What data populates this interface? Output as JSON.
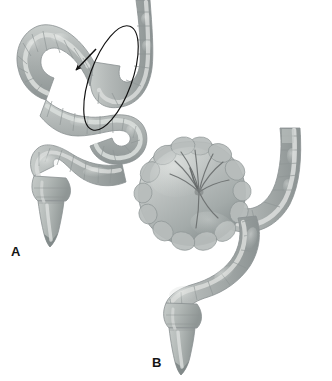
{
  "figure": {
    "background_color": "#ffffff",
    "width": 332,
    "height": 381,
    "render_style": "grayscale medical illustration",
    "panel_count": 2
  },
  "panels": [
    {
      "id": "a",
      "label": "A",
      "label_x": 11,
      "label_y": 245,
      "caption_text": "Redundant sigmoid colon with long mesentery; loop line marks the axis of rotation and the arrow indicates the point of twist",
      "annotations": [
        {
          "name": "rotation-loop",
          "kind": "ellipse-outline",
          "stroke_color": "#111111",
          "stroke_width": 1.1,
          "cx": 111,
          "cy": 78,
          "rx": 21,
          "ry": 55,
          "rotation_deg": 20
        },
        {
          "name": "twist-arrow",
          "kind": "arrow",
          "color": "#111111",
          "tail_x": 96,
          "tail_y": 49,
          "tip_x": 74,
          "tip_y": 72,
          "direction": "down-left"
        }
      ],
      "structures": [
        "descending colon",
        "redundant sigmoid loop",
        "rectosigmoid junction",
        "rectum",
        "anal canal"
      ]
    },
    {
      "id": "b",
      "label": "B",
      "label_x": 152,
      "label_y": 356,
      "caption_text": "Established volvulus: massively distended closed sigmoid loop with mucosal folds radiating toward the twisted mesenteric base",
      "annotations": [
        {
          "name": "twist-fold-convergence",
          "kind": "radiating-lines",
          "color": "#6d7171",
          "center_x": 199,
          "center_y": 190,
          "ray_count": 9
        }
      ],
      "structures": [
        "distended sigmoid loop",
        "twist point",
        "descending colon",
        "rectosigmoid junction",
        "rectum",
        "anal canal"
      ]
    }
  ],
  "palette": {
    "bowel_base": "#b4b9b8",
    "bowel_mid": "#a7adac",
    "bowel_shadow": "#8f9696",
    "bowel_deep_shadow": "#787f80",
    "bowel_highlight": "#d6dad8",
    "bowel_bright": "#e6e9e7",
    "taenia_band": "#d9dcda",
    "outline": "#8a9192",
    "annotation_stroke": "#111111",
    "label_text": "#141414",
    "background": "#ffffff"
  }
}
